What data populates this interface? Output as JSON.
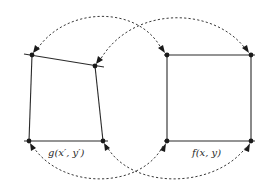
{
  "diagram": {
    "left_shape": {
      "label": "g(x′, y′)",
      "kind": "distorted-quadrilateral"
    },
    "right_shape": {
      "label": "f(x, y)",
      "kind": "square"
    },
    "correspondences": [
      {
        "from": "right.top-left",
        "to": "left.top-left",
        "style": "dashed-arrow"
      },
      {
        "from": "right.top-right",
        "to": "left.top-right",
        "style": "dashed-arrow"
      },
      {
        "from": "left.top-left",
        "to": "right.top-left",
        "style": "dashed-arrow"
      },
      {
        "from": "right.bottom-left",
        "to": "left.bottom-left",
        "style": "dashed-arrow"
      },
      {
        "from": "left.bottom-right",
        "to": "right.bottom-right",
        "style": "dashed-arrow"
      }
    ],
    "colors": {
      "line": "#2a2a2a",
      "vertex": "#1a1a1a",
      "background": "#ffffff"
    }
  }
}
